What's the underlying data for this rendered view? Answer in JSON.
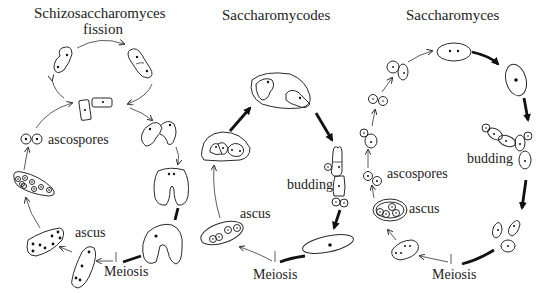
{
  "diagram": {
    "type": "yeast life cycles",
    "panels": [
      {
        "id": "schizosaccharomyces",
        "title": "Schizosaccharomyces",
        "subtitle": "fission",
        "labels": {
          "ascospores": "ascospores",
          "ascus": "ascus",
          "meiosis": "Meiosis"
        }
      },
      {
        "id": "saccharomycodes",
        "title": "Saccharomycodes",
        "labels": {
          "budding": "budding",
          "ascus": "ascus",
          "meiosis": "Meiosis"
        }
      },
      {
        "id": "saccharomyces",
        "title": "Saccharomyces",
        "labels": {
          "budding": "budding",
          "ascospores": "ascospores",
          "ascus": "ascus",
          "meiosis": "Meiosis"
        }
      }
    ],
    "colors": {
      "ink": "#222222",
      "background": "#ffffff"
    }
  }
}
